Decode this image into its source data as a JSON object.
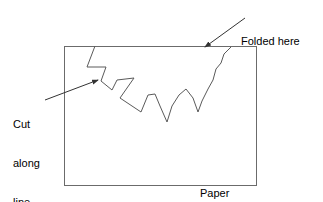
{
  "figure": {
    "width": 323,
    "height": 202,
    "background_color": "#ffffff",
    "stroke_color": "#555555",
    "text_color": "#000000"
  },
  "labels": {
    "folded_here": "Folded here",
    "cut_along_line": [
      "Cut",
      "along",
      "line"
    ],
    "paper": "Paper"
  },
  "shapes": {
    "paper_rect": {
      "name": "paper-sheet",
      "x": 64,
      "y": 46,
      "width": 192,
      "height": 139
    },
    "cut_line": {
      "name": "zigzag-cut-line",
      "points": "95,46 87,67 106,67 101,81 112,90 117,80 134,78 120,98 141,112 148,95 155,94 160,106 167,122 172,106 179,95 186,89 193,98 198,112 202,101 208,89 213,80 216,69 221,63 224,54 231,47"
    },
    "folded_arrow": {
      "name": "folded-here-arrow",
      "tail": [
        245,
        18
      ],
      "head": [
        205,
        47
      ]
    },
    "cut_arrow": {
      "name": "cut-along-line-arrow",
      "tail": [
        45,
        100
      ],
      "head": [
        98,
        80
      ]
    }
  }
}
